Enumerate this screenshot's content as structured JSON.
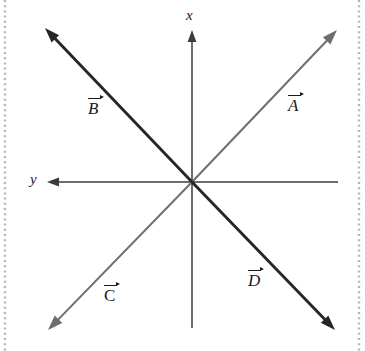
{
  "figure": {
    "kind": "vector-diagram",
    "background_color": "#ffffff",
    "width": 365,
    "height": 351,
    "origin": {
      "x": 192,
      "y": 182
    }
  },
  "axes": {
    "vertical": {
      "name": "x",
      "label": "x",
      "label_position": {
        "x": 186,
        "y": 8
      },
      "arrow_end": "top",
      "color": "#3b3b3b",
      "from": {
        "x": 192,
        "y": 328
      },
      "to": {
        "x": 192,
        "y": 30
      }
    },
    "horizontal": {
      "name": "y",
      "label": "y",
      "label_position": {
        "x": 30,
        "y": 172
      },
      "arrow_end": "left",
      "color": "#3b3b3b",
      "from": {
        "x": 338,
        "y": 182
      },
      "to": {
        "x": 47,
        "y": 182
      }
    }
  },
  "vectors": [
    {
      "id": "A",
      "label": "A",
      "label_style": "italic",
      "label_position": {
        "x": 288,
        "y": 97
      },
      "color": "#6e6e6e",
      "stroke_width": 2.0,
      "from": {
        "x": 192,
        "y": 182
      },
      "to": {
        "x": 337,
        "y": 30
      },
      "direction": "up-right",
      "quadrant": "upper-right"
    },
    {
      "id": "B",
      "label": "B",
      "label_style": "italic",
      "label_position": {
        "x": 88,
        "y": 100
      },
      "color": "#262626",
      "stroke_width": 2.9,
      "from": {
        "x": 192,
        "y": 182
      },
      "to": {
        "x": 45,
        "y": 28
      },
      "direction": "up-left",
      "quadrant": "upper-left"
    },
    {
      "id": "C",
      "label": "C",
      "label_style": "upright",
      "label_position": {
        "x": 104,
        "y": 287
      },
      "color": "#6e6e6e",
      "stroke_width": 2.0,
      "from": {
        "x": 192,
        "y": 182
      },
      "to": {
        "x": 48,
        "y": 330
      },
      "direction": "down-left",
      "quadrant": "lower-left"
    },
    {
      "id": "D",
      "label": "D",
      "label_style": "italic",
      "label_position": {
        "x": 248,
        "y": 272
      },
      "color": "#262626",
      "stroke_width": 2.9,
      "from": {
        "x": 192,
        "y": 182
      },
      "to": {
        "x": 335,
        "y": 330
      },
      "direction": "down-right",
      "quadrant": "lower-right"
    }
  ],
  "decorations": {
    "left_dotted_rule": {
      "x": 5,
      "color": "#b5b5b5"
    },
    "right_dotted_rule": {
      "x": 359,
      "color": "#b5b5b5"
    }
  }
}
